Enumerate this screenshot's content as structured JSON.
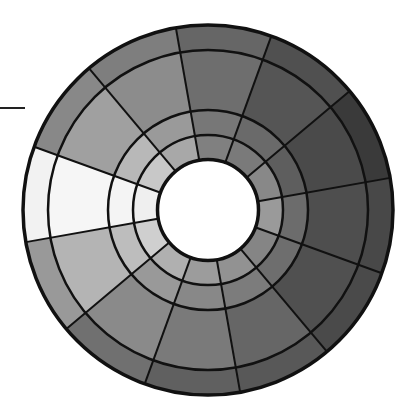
{
  "diagram": {
    "type": "segmented-polar-bullseye",
    "colormap": "grayscale",
    "center": [
      208,
      210
    ],
    "hole_radius": 51,
    "ring_radii": [
      51,
      75,
      100,
      160,
      185
    ],
    "ring_names": [
      "ring-1-inner",
      "ring-2",
      "ring-3-wide",
      "ring-4-outer"
    ],
    "segment_count": 12,
    "start_angle_deg": -100,
    "segment_span_deg": 30,
    "line_color": "#111111",
    "outer_line_width": 3.5,
    "ring_line_width": 2.5,
    "radial_line_width": 2,
    "hole_fill": "#ffffff",
    "segments": [
      {
        "id": 0,
        "position": "top",
        "fills": [
          "#808080",
          "#777777",
          "#6e6e6e",
          "#666666"
        ]
      },
      {
        "id": 1,
        "position": "top-right",
        "fills": [
          "#7a7a7a",
          "#6a6a6a",
          "#555555",
          "#505050"
        ]
      },
      {
        "id": 2,
        "position": "right-upper",
        "fills": [
          "#888888",
          "#5e5e5e",
          "#4a4a4a",
          "#3a3a3a"
        ]
      },
      {
        "id": 3,
        "position": "right",
        "fills": [
          "#9a9a9a",
          "#6c6c6c",
          "#4e4e4e",
          "#484848"
        ]
      },
      {
        "id": 4,
        "position": "lower-right",
        "fills": [
          "#858585",
          "#6e6e6e",
          "#505050",
          "#4a4a4a"
        ]
      },
      {
        "id": 5,
        "position": "bottom-right",
        "fills": [
          "#929292",
          "#7c7c7c",
          "#666666",
          "#585858"
        ]
      },
      {
        "id": 6,
        "position": "bottom",
        "fills": [
          "#9c9c9c",
          "#888888",
          "#7a7a7a",
          "#606060"
        ]
      },
      {
        "id": 7,
        "position": "lower-left",
        "fills": [
          "#b0b0b0",
          "#999999",
          "#8a8a8a",
          "#707070"
        ]
      },
      {
        "id": 8,
        "position": "left-lower",
        "fills": [
          "#cfcfcf",
          "#bdbdbd",
          "#b4b4b4",
          "#999999"
        ]
      },
      {
        "id": 9,
        "position": "left",
        "fills": [
          "#efefef",
          "#f4f4f4",
          "#f6f6f6",
          "#f2f2f2"
        ]
      },
      {
        "id": 10,
        "position": "upper-left",
        "fills": [
          "#c8c8c8",
          "#b8b8b8",
          "#a0a0a0",
          "#888888"
        ]
      },
      {
        "id": 11,
        "position": "top-left",
        "fills": [
          "#a8a8a8",
          "#9a9a9a",
          "#8c8c8c",
          "#7e7e7e"
        ]
      }
    ],
    "pointer": {
      "description": "short horizontal marker line at left edge",
      "x1": 0,
      "x2": 25,
      "y": 107
    }
  }
}
